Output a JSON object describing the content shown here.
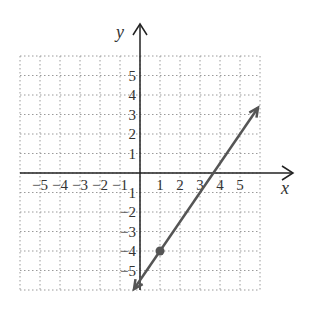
{
  "chart_data": {
    "type": "line",
    "title": "",
    "xlabel": "x",
    "ylabel": "y",
    "xlim": [
      -6,
      6
    ],
    "ylim": [
      -6,
      6
    ],
    "grid": true,
    "x_ticks": [
      "-5",
      "-4",
      "-3",
      "-2",
      "-1",
      "1",
      "2",
      "3",
      "4",
      "5"
    ],
    "y_ticks": [
      "5",
      "4",
      "3",
      "2",
      "1",
      "-1",
      "-2",
      "-3",
      "-4",
      "-5"
    ],
    "series": [
      {
        "name": "line",
        "equation": "y = 1.5x - 5.5",
        "x": [
          -0.3,
          5.9
        ],
        "y": [
          -5.95,
          3.35
        ],
        "arrows": "both",
        "color": "#555555"
      }
    ],
    "points": [
      {
        "x": 1,
        "y": -4,
        "color": "#555555"
      }
    ]
  },
  "labels": {
    "x_axis": "x",
    "y_axis": "y",
    "x_ticks": [
      "−5",
      "−4",
      "−3",
      "−2",
      "−1",
      "1",
      "2",
      "3",
      "4",
      "5"
    ],
    "y_ticks": [
      "5",
      "4",
      "3",
      "2",
      "1",
      "−1",
      "−2",
      "−3",
      "−4",
      "−5"
    ]
  }
}
